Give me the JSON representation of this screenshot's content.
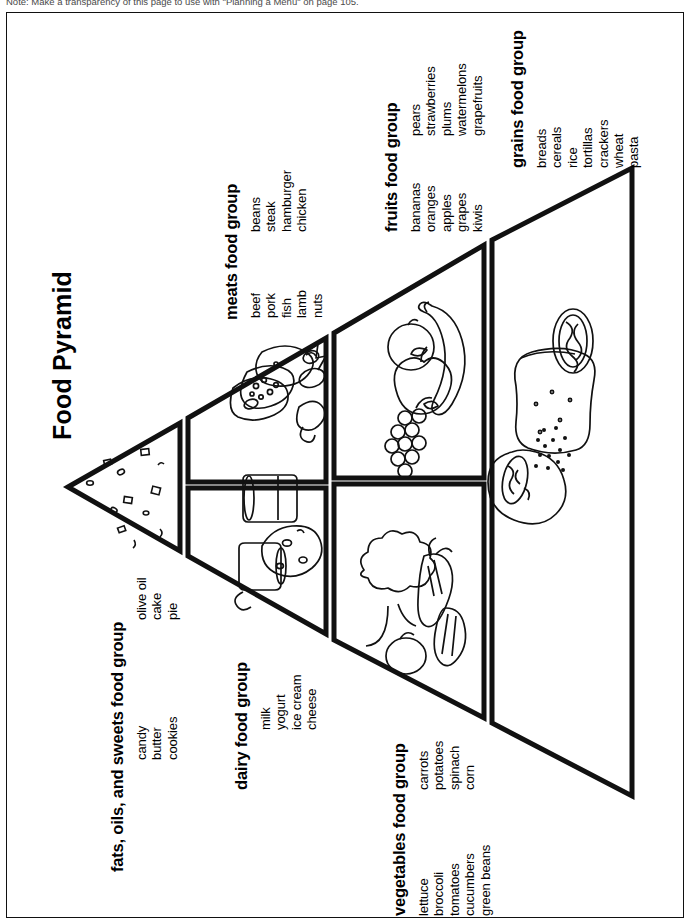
{
  "page": {
    "note": "Note: Make a transparency of this page to use with \"Planning a Menu\" on page 105.",
    "title": "Food Pyramid"
  },
  "groups": [
    {
      "id": "fats",
      "title": "fats, oils, and sweets food group",
      "col1": [
        "candy",
        "butter",
        "cookies"
      ],
      "col2": [
        "olive oil",
        "cake",
        "pie"
      ]
    },
    {
      "id": "dairy",
      "title": "dairy food group",
      "col1": [
        "milk",
        "yogurt",
        "ice cream",
        "cheese"
      ],
      "col2": []
    },
    {
      "id": "meats",
      "title": "meats food group",
      "col1": [
        "beef",
        "pork",
        "fish",
        "lamb",
        "nuts"
      ],
      "col2": [
        "beans",
        "steak",
        "hamburger",
        "chicken"
      ]
    },
    {
      "id": "vegetables",
      "title": "vegetables food group",
      "col1": [
        "lettuce",
        "broccoli",
        "tomatoes",
        "cucumbers",
        "green beans"
      ],
      "col2": [
        "carrots",
        "potatoes",
        "spinach",
        "corn"
      ]
    },
    {
      "id": "fruits",
      "title": "fruits food group",
      "col1": [
        "bananas",
        "oranges",
        "apples",
        "grapes",
        "kiwis"
      ],
      "col2": [
        "pears",
        "strawberries",
        "plums",
        "watermelons",
        "grapefruits"
      ]
    },
    {
      "id": "grains",
      "title": "grains food group",
      "col1": [
        "breads",
        "cereals",
        "rice",
        "tortillas",
        "crackers",
        "wheat",
        "pasta"
      ],
      "col2": []
    }
  ],
  "colors": {
    "ink": "#111111",
    "paper": "#ffffff",
    "note_gray": "#4a4a4a"
  }
}
